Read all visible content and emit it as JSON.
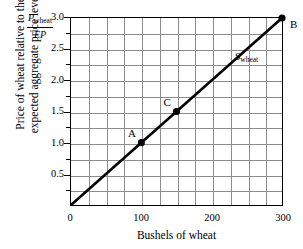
{
  "chart_data": {
    "type": "line",
    "title": "",
    "xlabel": "Bushels of wheat",
    "ylabel_line1": "Price of wheat relative to the",
    "ylabel_line2": "expected aggregate price level",
    "ylabel_fraction_numerator": "P",
    "ylabel_fraction_numerator_sub": "wheat",
    "ylabel_fraction_denominator": "EP",
    "xlim": [
      0,
      300
    ],
    "ylim": [
      0,
      3.0
    ],
    "grid": true,
    "x_major_ticks": [
      0,
      100,
      200,
      300
    ],
    "x_major_tick_labels": [
      "0",
      "100",
      "200",
      "300"
    ],
    "x_gridline_step": 25,
    "y_major_ticks": [
      0.5,
      1.0,
      1.5,
      2.0,
      2.5,
      3.0
    ],
    "y_major_tick_labels": [
      "0.5",
      "1.0",
      "1.5",
      "2.0",
      "2.5",
      "3.0"
    ],
    "y_gridline_step": 0.25,
    "legend_position": "inline-on-curve",
    "series": [
      {
        "name": "S_wheat",
        "label_text": "S",
        "label_subscript": "wheat",
        "x": [
          0,
          300
        ],
        "values": [
          0,
          3.0
        ],
        "color": "#000000"
      }
    ],
    "points": [
      {
        "label": "A",
        "x": 100,
        "y": 1.0
      },
      {
        "label": "C",
        "x": 150,
        "y": 1.5
      },
      {
        "label": "B",
        "x": 300,
        "y": 3.0
      }
    ]
  },
  "colors": {
    "axis": "#000000",
    "grid": "#8d8d8d",
    "curve": "#000000",
    "background": "#ffffff"
  }
}
